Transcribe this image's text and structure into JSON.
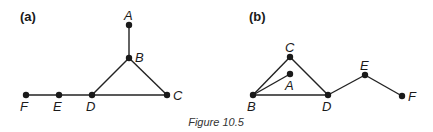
{
  "caption": "Figure 10.5",
  "panels": [
    {
      "label": "(a)",
      "nodes": {
        "A": {
          "x": 129,
          "y": 25,
          "lx": 124,
          "ly": 20
        },
        "B": {
          "x": 129,
          "y": 58,
          "lx": 135,
          "ly": 62
        },
        "C": {
          "x": 167,
          "y": 95,
          "lx": 173,
          "ly": 100
        },
        "D": {
          "x": 92,
          "y": 95,
          "lx": 86,
          "ly": 111
        },
        "E": {
          "x": 59,
          "y": 95,
          "lx": 53,
          "ly": 111
        },
        "F": {
          "x": 26,
          "y": 95,
          "lx": 20,
          "ly": 111
        }
      },
      "edges": [
        [
          "A",
          "B"
        ],
        [
          "B",
          "D"
        ],
        [
          "B",
          "C"
        ],
        [
          "D",
          "C"
        ],
        [
          "F",
          "E"
        ],
        [
          "E",
          "D"
        ]
      ]
    },
    {
      "label": "(b)",
      "nodes": {
        "C": {
          "x": 290,
          "y": 57,
          "lx": 285,
          "ly": 52
        },
        "A": {
          "x": 290,
          "y": 74,
          "lx": 285,
          "ly": 90
        },
        "B": {
          "x": 253,
          "y": 95,
          "lx": 247,
          "ly": 111
        },
        "D": {
          "x": 328,
          "y": 95,
          "lx": 322,
          "ly": 111
        },
        "E": {
          "x": 365,
          "y": 75,
          "lx": 360,
          "ly": 70
        },
        "F": {
          "x": 402,
          "y": 96,
          "lx": 408,
          "ly": 101
        }
      },
      "edges": [
        [
          "B",
          "C"
        ],
        [
          "C",
          "D"
        ],
        [
          "B",
          "A"
        ],
        [
          "B",
          "D"
        ],
        [
          "D",
          "E"
        ],
        [
          "E",
          "F"
        ]
      ]
    }
  ]
}
